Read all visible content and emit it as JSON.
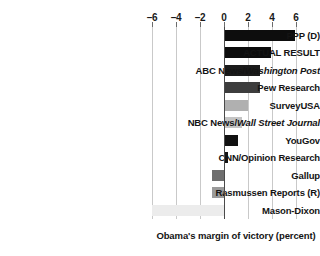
{
  "chart_data": {
    "type": "bar",
    "orientation": "horizontal",
    "title": "",
    "xlabel": "Obama's margin of victory (percent)",
    "ylabel": "",
    "xlim": [
      -6,
      6
    ],
    "xticks": [
      -6,
      -4,
      -2,
      0,
      2,
      4,
      6
    ],
    "xtick_labels": [
      "–6",
      "–4",
      "–2",
      "0",
      "2",
      "4",
      "6"
    ],
    "grid": true,
    "legend": "none",
    "zero_line": 0,
    "categories": [
      "PPP (D)",
      "ACTUAL RESULT",
      "ABC News/Washington Post",
      "Pew Research",
      "SurveyUSA",
      "NBC News/Wall Street Journal",
      "YouGov",
      "CNN/Opinion Research",
      "Gallup",
      "Rasmussen Reports (R)",
      "Mason-Dixon"
    ],
    "values": [
      5.9,
      3.9,
      3.0,
      3.0,
      2.0,
      1.5,
      1.2,
      0.3,
      -1.0,
      -1.0,
      -6.0
    ],
    "bars": [
      {
        "label_plain": "PPP (D)",
        "label_pre": "PPP (D)",
        "label_italic": "",
        "label_post": "",
        "value": 5.9,
        "color": "#0d0d0d"
      },
      {
        "label_plain": "ACTUAL RESULT",
        "label_pre": "ACTUAL RESULT",
        "label_italic": "",
        "label_post": "",
        "value": 3.9,
        "color": "#0d0d0d"
      },
      {
        "label_plain": "ABC News/Washington Post",
        "label_pre": "ABC News/",
        "label_italic": "Washington Post",
        "label_post": "",
        "value": 3.0,
        "color": "#1a1a1a"
      },
      {
        "label_plain": "Pew Research",
        "label_pre": "Pew Research",
        "label_italic": "",
        "label_post": "",
        "value": 3.0,
        "color": "#3d3d3d"
      },
      {
        "label_plain": "SurveyUSA",
        "label_pre": "SurveyUSA",
        "label_italic": "",
        "label_post": "",
        "value": 2.0,
        "color": "#b0b0b0"
      },
      {
        "label_plain": "NBC News/Wall Street Journal",
        "label_pre": "NBC News/",
        "label_italic": "Wall Street Journal",
        "label_post": "",
        "value": 1.5,
        "color": "#c4c4c4"
      },
      {
        "label_plain": "YouGov",
        "label_pre": "YouGov",
        "label_italic": "",
        "label_post": "",
        "value": 1.2,
        "color": "#111111"
      },
      {
        "label_plain": "CNN/Opinion Research",
        "label_pre": "CNN/Opinion Research",
        "label_italic": "",
        "label_post": "",
        "value": 0.3,
        "color": "#141414"
      },
      {
        "label_plain": "Gallup",
        "label_pre": "Gallup",
        "label_italic": "",
        "label_post": "",
        "value": -1.0,
        "color": "#6e6e6e"
      },
      {
        "label_plain": "Rasmussen Reports (R)",
        "label_pre": "Rasmussen Reports (R)",
        "label_italic": "",
        "label_post": "",
        "value": -1.0,
        "color": "#9a9a9a"
      },
      {
        "label_plain": "Mason-Dixon",
        "label_pre": "Mason-Dixon",
        "label_italic": "",
        "label_post": "",
        "value": -6.0,
        "color": "#ececec"
      }
    ]
  },
  "axis": {
    "caption": "Obama's margin of victory (percent)",
    "tick_labels": [
      "–6",
      "–4",
      "–2",
      "0",
      "2",
      "4",
      "6"
    ],
    "tick_values": [
      -6,
      -4,
      -2,
      0,
      2,
      4,
      6
    ]
  },
  "colors": {
    "background": "#ffffff",
    "gridline": "#c9c9c9",
    "zero_line": "#4a4a4a",
    "text": "#141414"
  }
}
